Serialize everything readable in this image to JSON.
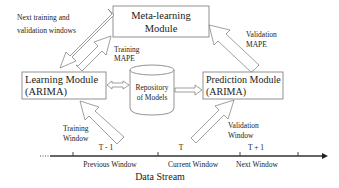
{
  "diagram": {
    "modules": {
      "meta": {
        "line1": "Meta-learning",
        "line2": "Module"
      },
      "learning": {
        "line1": "Learning Module",
        "line2": "(ARIMA)"
      },
      "repository": {
        "line1": "Repository",
        "line2": "of Models"
      },
      "prediction": {
        "line1": "Prediction Module",
        "line2": "(ARIMA)"
      }
    },
    "arrows": {
      "next_windows": {
        "line1": "Next training and",
        "line2": "validation windows"
      },
      "training_mape": {
        "line1": "Training",
        "line2": "MAPE"
      },
      "validation_mape": {
        "line1": "Validation",
        "line2": "MAPE"
      },
      "training_window": {
        "line1": "Training",
        "line2": "Window"
      },
      "validation_window": {
        "line1": "Validation",
        "line2": "Window"
      }
    },
    "timeline": {
      "periods": [
        {
          "time": "T - 1",
          "window": "Previous Window"
        },
        {
          "time": "T",
          "window": "Current Window"
        },
        {
          "time": "T + 1",
          "window": "Next Window"
        }
      ],
      "label": "Data Stream"
    }
  }
}
